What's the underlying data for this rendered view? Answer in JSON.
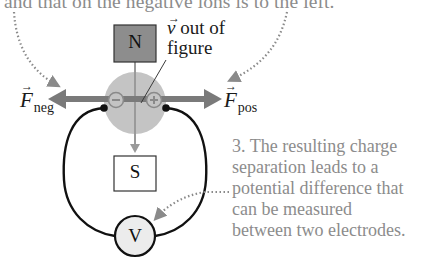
{
  "captions": {
    "top": "and that on the negative ions is to the left.",
    "right_lines": [
      "3. The resulting charge",
      "separation leads to a",
      "potential difference that",
      "can be measured",
      "between two electrodes."
    ]
  },
  "labels": {
    "north_pole": "N",
    "south_pole": "S",
    "voltmeter": "V",
    "velocity_symbol": "v",
    "velocity_line1": " out of",
    "velocity_line2": "figure",
    "force_negative_symbol": "F",
    "force_negative_sub": "neg",
    "force_positive_symbol": "F",
    "force_positive_sub": "pos",
    "negative_charge": "−",
    "positive_charge": "+"
  },
  "icons": {
    "vector_arrow": "→"
  },
  "colors": {
    "caption_text": "#8c8c8c",
    "north_magnet_fill": "#8d8d8d",
    "south_magnet_fill": "#ffffff",
    "channel_fill": "#c4c4c4",
    "force_arrow": "#7a7a7a",
    "dotted_leader": "#8a8a8a",
    "wire": "#111111",
    "voltmeter_fill": "#ececec"
  }
}
